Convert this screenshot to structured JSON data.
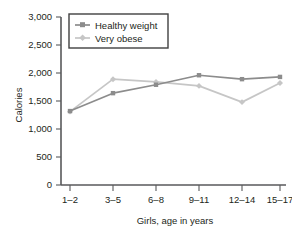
{
  "chart_data": {
    "type": "line",
    "title": "",
    "xlabel": "Girls, age in years",
    "ylabel": "Calories",
    "categories": [
      "1–2",
      "3–5",
      "6–8",
      "9–11",
      "12–14",
      "15–17"
    ],
    "ylim": [
      0,
      3000
    ],
    "yticks": [
      0,
      500,
      1000,
      1500,
      2000,
      2500,
      3000
    ],
    "ytick_labels": [
      "0",
      "500",
      "1,000",
      "1,500",
      "2,000",
      "2,500",
      "3,000"
    ],
    "grid": false,
    "legend_position": "top-left-inside",
    "series": [
      {
        "name": "Healthy weight",
        "color": "#8c8c8c",
        "marker": "square",
        "values": [
          1320,
          1640,
          1790,
          1960,
          1890,
          1930
        ]
      },
      {
        "name": "Very obese",
        "color": "#c6c6c6",
        "marker": "diamond",
        "values": [
          1310,
          1890,
          1840,
          1770,
          1480,
          1820
        ]
      }
    ]
  },
  "legend": {
    "items": [
      {
        "label": "Healthy weight"
      },
      {
        "label": "Very obese"
      }
    ]
  },
  "colors": {
    "healthy_weight": "#8c8c8c",
    "very_obese": "#c6c6c6",
    "axis": "#58595b",
    "text": "#231f20",
    "background": "#ffffff"
  }
}
